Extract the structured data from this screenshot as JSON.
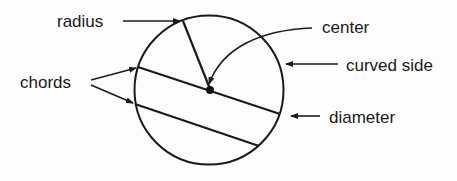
{
  "diagram": {
    "labels": {
      "radius": "radius",
      "center": "center",
      "curved_side": "curved side",
      "chords": "chords",
      "diameter": "diameter"
    }
  }
}
